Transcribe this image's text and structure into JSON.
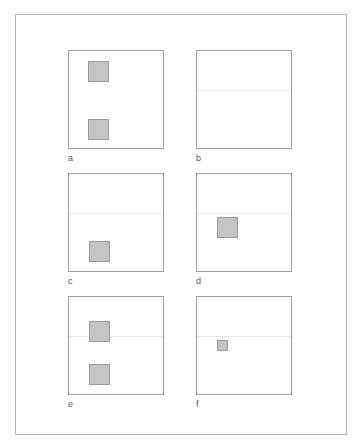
{
  "figure": {
    "panels": [
      {
        "id": "a",
        "label": "a",
        "left": 68,
        "top": 50,
        "hline": null,
        "squares": [
          {
            "x": 19,
            "y": 10,
            "size": 21
          },
          {
            "x": 19,
            "y": 68,
            "size": 21
          }
        ]
      },
      {
        "id": "b",
        "label": "b",
        "left": 196,
        "top": 50,
        "hline": 39,
        "squares": []
      },
      {
        "id": "c",
        "label": "c",
        "left": 68,
        "top": 173,
        "hline": 39,
        "squares": [
          {
            "x": 20,
            "y": 67,
            "size": 21
          }
        ]
      },
      {
        "id": "d",
        "label": "d",
        "left": 196,
        "top": 173,
        "hline": 39,
        "squares": [
          {
            "x": 20,
            "y": 43,
            "size": 21
          }
        ]
      },
      {
        "id": "e",
        "label": "e",
        "left": 68,
        "top": 296,
        "hline": 39,
        "squares": [
          {
            "x": 20,
            "y": 24,
            "size": 21
          },
          {
            "x": 20,
            "y": 67,
            "size": 21
          }
        ]
      },
      {
        "id": "f",
        "label": "f",
        "left": 196,
        "top": 296,
        "hline": 39,
        "squares": [
          {
            "x": 20,
            "y": 43,
            "size": 11
          }
        ]
      }
    ],
    "colors": {
      "square_fill": "#c4c4c4",
      "square_border": "#9a9a9a",
      "panel_border": "#9e9e9e",
      "divider": "#ece8e8"
    }
  }
}
